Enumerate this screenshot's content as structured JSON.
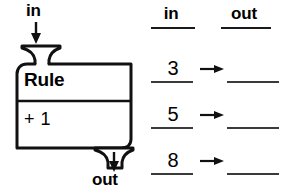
{
  "machine": {
    "input_label": "in",
    "output_label": "out",
    "title": "Rule",
    "operation": "+ 1",
    "input_arrow_icon": "arrow-down-icon",
    "output_arrow_icon": "arrow-down-icon",
    "input_funnel_icon": "funnel-icon",
    "output_funnel_icon": "funnel-icon"
  },
  "table": {
    "headers": {
      "in": "in",
      "out": "out"
    },
    "rows": [
      {
        "in": "3",
        "out": "",
        "arrow_icon": "arrow-right-icon"
      },
      {
        "in": "5",
        "out": "",
        "arrow_icon": "arrow-right-icon"
      },
      {
        "in": "8",
        "out": "",
        "arrow_icon": "arrow-right-icon"
      }
    ]
  },
  "colors": {
    "ink": "#000000",
    "line": "#1a1a1a",
    "blank_line": "#3a3a3a",
    "background": "#ffffff"
  }
}
